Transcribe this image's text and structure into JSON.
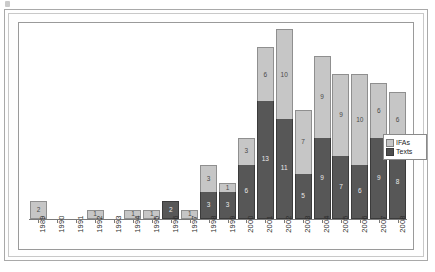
{
  "chart_data": {
    "type": "bar",
    "stacked": true,
    "title": "",
    "subtitle": "",
    "xlabel": "",
    "ylabel": "",
    "grid": false,
    "legend_position": "right",
    "ylim": [
      0,
      21
    ],
    "categories": [
      "1989",
      "1990",
      "1991",
      "1992",
      "1993",
      "1994",
      "1995",
      "1996",
      "1997",
      "1998",
      "1999",
      "2000",
      "2001",
      "2002",
      "2003",
      "2004",
      "2005",
      "2006",
      "2007",
      "2008"
    ],
    "series": [
      {
        "name": "Texts",
        "color": "#575757",
        "values": [
          0,
          0,
          0,
          0,
          0,
          0,
          0,
          2,
          0,
          3,
          3,
          6,
          13,
          11,
          5,
          9,
          7,
          6,
          9,
          8
        ]
      },
      {
        "name": "IFAs",
        "color": "#c6c6c6",
        "values": [
          2,
          0,
          0,
          1,
          0,
          1,
          1,
          0,
          1,
          3,
          1,
          3,
          6,
          10,
          7,
          9,
          9,
          10,
          6,
          6
        ]
      }
    ],
    "bar_labels": {
      "1989": {
        "ifas": "2",
        "texts": ""
      },
      "1990": {
        "ifas": "",
        "texts": ""
      },
      "1991": {
        "ifas": "",
        "texts": ""
      },
      "1992": {
        "ifas": "1",
        "texts": ""
      },
      "1993": {
        "ifas": "",
        "texts": ""
      },
      "1994": {
        "ifas": "1",
        "texts": ""
      },
      "1995": {
        "ifas": "1",
        "texts": ""
      },
      "1996": {
        "ifas": "",
        "texts": "2"
      },
      "1997": {
        "ifas": "1",
        "texts": ""
      },
      "1998": {
        "ifas": "3",
        "texts": "3"
      },
      "1999": {
        "ifas": "1",
        "texts": "3"
      },
      "2000": {
        "ifas": "3",
        "texts": "6"
      },
      "2001": {
        "ifas": "6",
        "texts": "13"
      },
      "2002": {
        "ifas": "10",
        "texts": "11"
      },
      "2003": {
        "ifas": "7",
        "texts": "5"
      },
      "2004": {
        "ifas": "9",
        "texts": "9"
      },
      "2005": {
        "ifas": "9",
        "texts": "7"
      },
      "2006": {
        "ifas": "10",
        "texts": "6"
      },
      "2007": {
        "ifas": "6",
        "texts": "9"
      },
      "2008": {
        "ifas": "6",
        "texts": "8"
      }
    }
  },
  "legend": {
    "items": [
      {
        "label": "IFAs",
        "swatch": "ifas"
      },
      {
        "label": "Texts",
        "swatch": "texts"
      }
    ]
  },
  "colors": {
    "ifas": "#c6c6c6",
    "texts": "#575757",
    "axis": "#7a7a7a",
    "frame": "#9a9a9a",
    "background": "#ffffff"
  }
}
